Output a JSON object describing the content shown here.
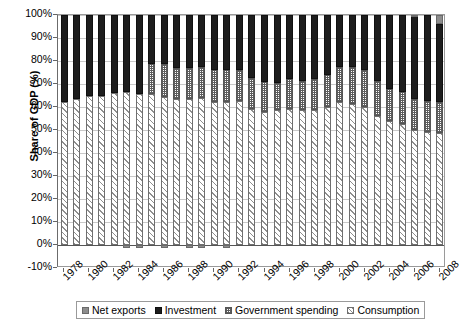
{
  "chart_data": {
    "type": "bar",
    "stacked": true,
    "title": "",
    "xlabel": "",
    "ylabel": "Share of GDP (%)",
    "ylim": [
      -10,
      100
    ],
    "ytick_labels": [
      "100%",
      "90%",
      "80%",
      "70%",
      "60%",
      "50%",
      "40%",
      "30%",
      "20%",
      "10%",
      "0%",
      "-10%"
    ],
    "ytick_values": [
      100,
      90,
      80,
      70,
      60,
      50,
      40,
      30,
      20,
      10,
      0,
      -10
    ],
    "grid": true,
    "legend_position": "bottom",
    "x": [
      1978,
      1979,
      1980,
      1981,
      1982,
      1983,
      1984,
      1985,
      1986,
      1987,
      1988,
      1989,
      1990,
      1991,
      1992,
      1993,
      1994,
      1995,
      1996,
      1997,
      1998,
      1999,
      2000,
      2001,
      2002,
      2003,
      2004,
      2005,
      2006,
      2007,
      2008
    ],
    "xtick_labels": [
      "1978",
      "1980",
      "1982",
      "1984",
      "1986",
      "1988",
      "1990",
      "1992",
      "1994",
      "1996",
      "1998",
      "2000",
      "2002",
      "2004",
      "2006",
      "2008"
    ],
    "xtick_values": [
      1978,
      1980,
      1982,
      1984,
      1986,
      1988,
      1990,
      1992,
      1994,
      1996,
      1998,
      2000,
      2002,
      2004,
      2006,
      2008
    ],
    "series": [
      {
        "name": "Consumption",
        "pattern": "diagonal-hatch",
        "color": "#8e8e8e",
        "values": [
          62,
          63.5,
          65,
          65,
          66,
          66.5,
          65.5,
          65.5,
          64.5,
          63.5,
          63.5,
          64,
          62,
          62,
          62.5,
          59,
          58,
          58.5,
          59,
          58.5,
          58.5,
          60,
          62,
          61.5,
          60,
          56,
          54,
          52.5,
          50,
          49,
          48.5
        ]
      },
      {
        "name": "Government spending",
        "pattern": "checkered",
        "color": "#5d5d5d",
        "values": [
          0,
          0,
          0,
          0,
          0,
          0,
          0,
          13,
          14,
          13.5,
          13.5,
          13.5,
          14,
          14,
          13.5,
          13.5,
          13,
          12,
          13,
          13,
          13.5,
          14,
          15.5,
          16,
          16,
          15.5,
          14,
          14,
          13.5,
          13.5,
          13.5
        ]
      },
      {
        "name": "Investment",
        "pattern": "solid",
        "color": "#1d1d1d",
        "values": [
          38,
          36.5,
          35,
          35,
          34,
          33.5,
          34.5,
          21.5,
          21.5,
          23,
          23,
          22.5,
          24,
          24,
          24,
          27.5,
          29,
          29.5,
          28,
          28.5,
          28,
          26,
          22.5,
          22.5,
          24,
          28.5,
          32,
          33.5,
          36,
          37.5,
          34
        ]
      },
      {
        "name": "Net exports",
        "pattern": "solid",
        "color": "#8d8d8d",
        "values": [
          0,
          0,
          0,
          0,
          0,
          -1.5,
          -1.5,
          0,
          -0.5,
          0,
          -0.5,
          -0.5,
          0,
          -1.5,
          0,
          0,
          0,
          0,
          0,
          0,
          0,
          0,
          0,
          0,
          0,
          0,
          0,
          0,
          0.5,
          0,
          4
        ]
      }
    ],
    "annotations": []
  },
  "legend": {
    "items": [
      {
        "label": "Net exports",
        "key": "netexports"
      },
      {
        "label": "Investment",
        "key": "investment"
      },
      {
        "label": "Government spending",
        "key": "govt"
      },
      {
        "label": "Consumption",
        "key": "consumption"
      }
    ]
  }
}
